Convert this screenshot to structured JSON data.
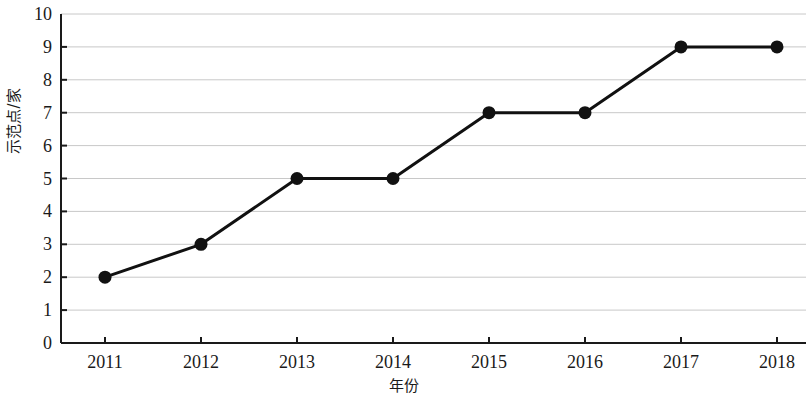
{
  "chart_data": {
    "type": "line",
    "title": "",
    "xlabel": "年份",
    "ylabel": "示范点/家",
    "categories": [
      "2011",
      "2012",
      "2013",
      "2014",
      "2015",
      "2016",
      "2017",
      "2018"
    ],
    "x": [
      2011,
      2012,
      2013,
      2014,
      2015,
      2016,
      2017,
      2018
    ],
    "values": [
      2,
      3,
      5,
      5,
      7,
      7,
      9,
      9
    ],
    "series": [
      {
        "name": "示范点/家",
        "values": [
          2,
          3,
          5,
          5,
          7,
          7,
          9,
          9
        ]
      }
    ],
    "ylim": [
      0,
      10
    ],
    "y_ticks": [
      0,
      1,
      2,
      3,
      4,
      5,
      6,
      7,
      8,
      9,
      10
    ],
    "y_tick_labels": [
      "0",
      "1",
      "2",
      "3",
      "4",
      "5",
      "6",
      "7",
      "8",
      "9",
      "10"
    ],
    "x_tick_labels": [
      "2011",
      "2012",
      "2013",
      "2014",
      "2015",
      "2016",
      "2017",
      "2018"
    ],
    "grid": "horizontal",
    "legend": "none",
    "marker": "filled-circle",
    "line_color": "#111111",
    "marker_color": "#111111",
    "grid_color": "#c8c8c8",
    "axis_color": "#1a1a1a",
    "background_color": "#ffffff",
    "annotations": []
  },
  "axes": {
    "y_title": "示范点/家",
    "x_title": "年份"
  }
}
